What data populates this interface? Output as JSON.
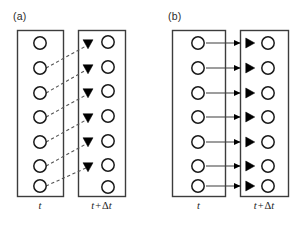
{
  "figure": {
    "width": 307,
    "height": 226,
    "background": "#ffffff",
    "stroke_color": "#3c3c3c",
    "circle_stroke": "#1a1a1a",
    "marker_fill": "#000000",
    "dashed_color": "#555555",
    "solid_line_color": "#3c3c3c"
  },
  "panels": [
    {
      "id": "a",
      "label": "(a)",
      "connector_style": "dashed-diagonal",
      "marker_glyph": "triangle-down",
      "boxes": [
        {
          "id": "a-left",
          "time_label_t": "t",
          "x": 17,
          "y": 30,
          "w": 46,
          "h": 166,
          "circle_count": 7,
          "circle_cx": 40,
          "circle_r": 6.2,
          "circle_ys": [
            43,
            68,
            93,
            117,
            142,
            166,
            186
          ]
        },
        {
          "id": "a-right",
          "time_label_t": "t",
          "time_label_op": "+",
          "time_label_delta": "Δ",
          "time_label_dt": "t",
          "x": 78,
          "y": 30,
          "w": 47,
          "h": 166,
          "circle_count": 7,
          "circle_cx": 108,
          "circle_r": 6.2,
          "circle_ys": [
            42,
            67,
            91,
            116,
            141,
            165,
            187
          ],
          "marker_cx": 88,
          "marker_count": 6,
          "marker_ys": [
            44,
            69,
            93,
            118,
            142,
            167
          ]
        }
      ],
      "connectors": [
        {
          "x1": 46,
          "y1": 68,
          "x2": 86,
          "y2": 46
        },
        {
          "x1": 46,
          "y1": 93,
          "x2": 86,
          "y2": 70
        },
        {
          "x1": 46,
          "y1": 117,
          "x2": 86,
          "y2": 95
        },
        {
          "x1": 46,
          "y1": 142,
          "x2": 86,
          "y2": 120
        },
        {
          "x1": 46,
          "y1": 166,
          "x2": 86,
          "y2": 144
        },
        {
          "x1": 46,
          "y1": 186,
          "x2": 86,
          "y2": 168
        }
      ]
    },
    {
      "id": "b",
      "label": "(b)",
      "connector_style": "solid-horizontal-arrow",
      "marker_glyph": "triangle-right",
      "boxes": [
        {
          "id": "b-left",
          "time_label_t": "t",
          "x": 172,
          "y": 30,
          "w": 53,
          "h": 166,
          "circle_count": 7,
          "circle_cx": 198,
          "circle_r": 6.2,
          "circle_ys": [
            43,
            68,
            93,
            117,
            142,
            166,
            186
          ]
        },
        {
          "id": "b-right",
          "time_label_t": "t",
          "time_label_op": "+",
          "time_label_delta": "Δ",
          "time_label_dt": "t",
          "x": 240,
          "y": 30,
          "w": 48,
          "h": 166,
          "circle_count": 7,
          "circle_cx": 268,
          "circle_r": 6.2,
          "circle_ys": [
            43,
            68,
            93,
            117,
            142,
            166,
            186
          ],
          "marker_cx": 250,
          "marker_count": 7,
          "marker_ys": [
            43,
            68,
            93,
            117,
            142,
            166,
            186
          ]
        }
      ],
      "connectors": [
        {
          "x1": 206,
          "y1": 43,
          "x2": 247,
          "y2": 43
        },
        {
          "x1": 206,
          "y1": 68,
          "x2": 247,
          "y2": 68
        },
        {
          "x1": 206,
          "y1": 93,
          "x2": 247,
          "y2": 93
        },
        {
          "x1": 206,
          "y1": 117,
          "x2": 247,
          "y2": 117
        },
        {
          "x1": 206,
          "y1": 142,
          "x2": 247,
          "y2": 142
        },
        {
          "x1": 206,
          "y1": 166,
          "x2": 247,
          "y2": 166
        },
        {
          "x1": 206,
          "y1": 186,
          "x2": 247,
          "y2": 186
        }
      ]
    }
  ]
}
